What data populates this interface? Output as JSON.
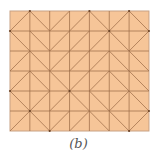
{
  "diagram": {
    "caption": "(b)",
    "grid": {
      "cols": 7,
      "rows": 6,
      "origin_x": 10,
      "origin_y": 11,
      "cell_w": 19.85,
      "cell_h": 20,
      "fill_color": "#f6c598",
      "line_color": "#9a6a45",
      "border_color": "#c8a184"
    },
    "diagonals": [
      [
        "/",
        "\\",
        "/",
        "/",
        "\\",
        "/",
        "\\"
      ],
      [
        "\\",
        "\\",
        "/",
        "/",
        "/",
        "\\",
        "/"
      ],
      [
        "/",
        "\\",
        "/",
        "/",
        "/",
        "\\",
        "\\"
      ],
      [
        "/",
        "\\",
        "\\",
        "/",
        "/",
        "\\",
        "\\"
      ],
      [
        "\\",
        "/",
        "/",
        "\\",
        "\\",
        "/",
        "\\"
      ],
      [
        "/",
        "\\",
        "/",
        "/",
        "\\",
        "\\",
        "/"
      ]
    ]
  }
}
